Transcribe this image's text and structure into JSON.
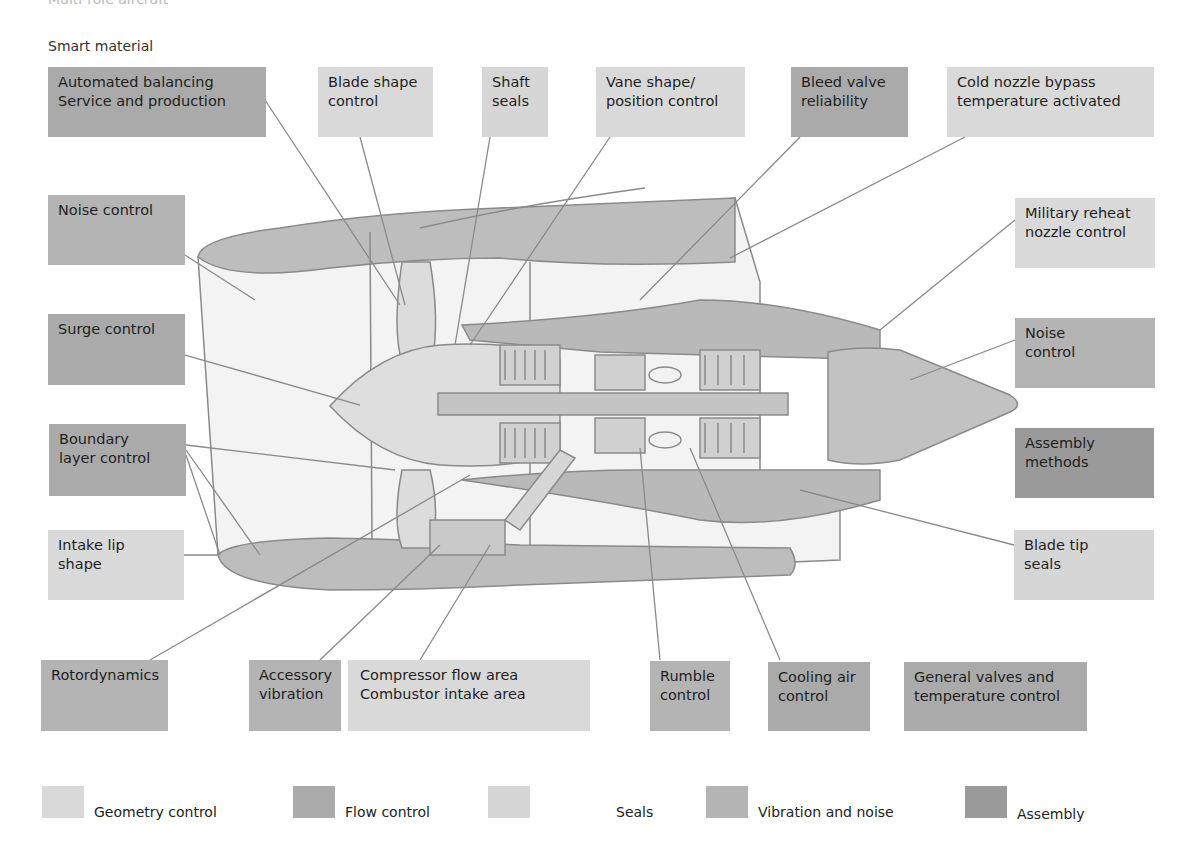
{
  "header": {
    "cut_title": "Multi-role aircraft",
    "subtitle": "Smart material"
  },
  "colors": {
    "geometry_control": "#d9d9d9",
    "flow_control": "#aaaaaa",
    "seals": "#d6d6d6",
    "vibration_and_noise": "#b4b4b4",
    "assembly": "#9a9a9a",
    "nacelle_dark": "#b9b9b9",
    "engine_light": "#e6e6e6",
    "leader_line": "#8a8a8a"
  },
  "labels": {
    "top": [
      {
        "lines": [
          "Automated balancing",
          "Service and production"
        ],
        "category": "flow"
      },
      {
        "lines": [
          "Blade shape",
          "control"
        ],
        "category": "geometry"
      },
      {
        "lines": [
          "Shaft",
          "seals"
        ],
        "category": "seals"
      },
      {
        "lines": [
          "Vane shape/",
          "position control"
        ],
        "category": "geometry"
      },
      {
        "lines": [
          "Bleed valve",
          "reliability"
        ],
        "category": "flow"
      },
      {
        "lines": [
          "Cold nozzle bypass",
          "temperature activated"
        ],
        "category": "geometry"
      }
    ],
    "left": [
      {
        "lines": [
          "Noise control"
        ],
        "category": "vibration"
      },
      {
        "lines": [
          "Surge control"
        ],
        "category": "flow"
      },
      {
        "lines": [
          "Boundary",
          "layer control"
        ],
        "category": "flow"
      },
      {
        "lines": [
          "Intake lip",
          "shape"
        ],
        "category": "geometry"
      }
    ],
    "right": [
      {
        "lines": [
          "Military reheat",
          "nozzle control"
        ],
        "category": "geometry"
      },
      {
        "lines": [
          "Noise",
          "control"
        ],
        "category": "vibration"
      },
      {
        "lines": [
          "Assembly",
          "methods"
        ],
        "category": "assembly"
      },
      {
        "lines": [
          "Blade tip",
          "seals"
        ],
        "category": "seals"
      }
    ],
    "bottom": [
      {
        "lines": [
          "Rotordynamics"
        ],
        "category": "vibration"
      },
      {
        "lines": [
          "Accessory",
          "vibration"
        ],
        "category": "vibration"
      },
      {
        "lines": [
          "Compressor flow area",
          "Combustor intake area"
        ],
        "category": "geometry"
      },
      {
        "lines": [
          "Rumble",
          "control"
        ],
        "category": "vibration"
      },
      {
        "lines": [
          "Cooling air",
          "control"
        ],
        "category": "flow"
      },
      {
        "lines": [
          "General valves and",
          "temperature control"
        ],
        "category": "flow"
      }
    ]
  },
  "legend": [
    {
      "label": "Geometry control",
      "color": "#d9d9d9"
    },
    {
      "label": "Flow control",
      "color": "#aaaaaa"
    },
    {
      "label": "Seals",
      "color": "#d6d6d6"
    },
    {
      "label": "Vibration and noise",
      "color": "#b4b4b4"
    },
    {
      "label": "Assembly",
      "color": "#9a9a9a"
    }
  ]
}
